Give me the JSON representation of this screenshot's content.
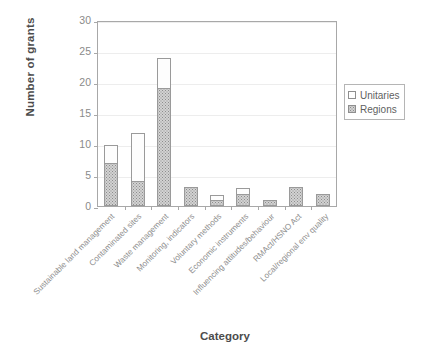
{
  "chart_data": {
    "type": "bar",
    "stacked": true,
    "title": "",
    "xlabel": "Category",
    "ylabel": "Number of grants",
    "ylim": [
      0,
      30
    ],
    "yticks": [
      0,
      5,
      10,
      15,
      20,
      25,
      30
    ],
    "grid": true,
    "legend_position": "right",
    "categories": [
      "Sustainable land management",
      "Contaminated sites",
      "Waste management",
      "Monitoring, indicators",
      "Voluntary methods",
      "Economic instruments",
      "Influencing attitudes/behaviour",
      "RMAct/HSNO Act",
      "Local/regional env quality"
    ],
    "series": [
      {
        "name": "Regions",
        "values": [
          7,
          4,
          19,
          3,
          1,
          2,
          1,
          3,
          2
        ],
        "color": "#d2d2d2"
      },
      {
        "name": "Unitaries",
        "values": [
          3,
          8,
          5,
          0,
          1,
          1,
          0,
          0,
          0
        ],
        "color": "#ffffff"
      }
    ],
    "totals": [
      10,
      12,
      24,
      3,
      2,
      3,
      1,
      3,
      2
    ]
  },
  "legend": {
    "items": [
      {
        "label": "Unitaries",
        "swatch": "unitaries-swatch"
      },
      {
        "label": "Regions",
        "swatch": "regions-swatch"
      }
    ]
  },
  "axis": {
    "y_title": "Number of grants",
    "x_title": "Category",
    "y_tick_labels": [
      "30",
      "25",
      "20",
      "15",
      "10",
      "5",
      "0"
    ]
  }
}
